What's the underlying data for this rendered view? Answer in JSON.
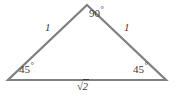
{
  "figure": {
    "name": "right-isosceles-triangle-45-45-90",
    "background_color": "#ffffff",
    "stroke_color": "#808080",
    "text_color": "#3a3a3a",
    "width": 175,
    "height": 95,
    "vertices": {
      "apex": {
        "x": 87,
        "y": 5
      },
      "left": {
        "x": 8,
        "y": 80
      },
      "right": {
        "x": 166,
        "y": 80
      }
    },
    "labels": {
      "angle_apex": "90",
      "angle_apex_unit": "°",
      "angle_left": "45",
      "angle_left_unit": "°",
      "angle_right": "45",
      "angle_right_unit": "°",
      "side_left": "1",
      "side_right": "1",
      "side_bottom_radical": "√",
      "side_bottom_radicand": "2"
    }
  }
}
